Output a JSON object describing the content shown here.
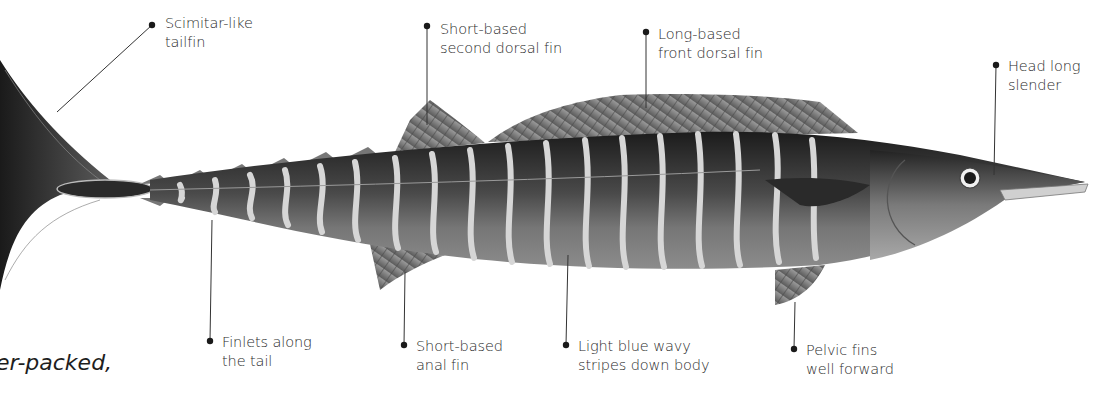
{
  "diagram": {
    "labels": [
      {
        "id": "tailfin",
        "lines": [
          "Scimitar-like",
          "tailfin"
        ]
      },
      {
        "id": "second-dorsal",
        "lines": [
          "Short-based",
          "second dorsal fin"
        ]
      },
      {
        "id": "front-dorsal",
        "lines": [
          "Long-based",
          "front dorsal fin"
        ]
      },
      {
        "id": "head",
        "lines": [
          "Head long",
          "slender"
        ]
      },
      {
        "id": "finlets",
        "lines": [
          "Finlets along",
          "the tail"
        ]
      },
      {
        "id": "anal-fin",
        "lines": [
          "Short-based",
          "anal fin"
        ]
      },
      {
        "id": "stripes",
        "lines": [
          "Light blue wavy",
          "stripes down body"
        ]
      },
      {
        "id": "pelvic",
        "lines": [
          "Pelvic fins",
          "well forward"
        ]
      }
    ],
    "caption_fragment": "er-packed,"
  },
  "colors": {
    "background": "#ffffff",
    "body_dark": "#2a2a2a",
    "body_mid": "#6e6e6e",
    "stripe": "#d4d4d4",
    "leader": "#333333"
  }
}
